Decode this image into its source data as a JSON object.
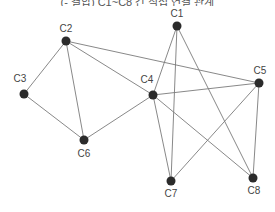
{
  "caption": "(- 결합) C1~C8 간 직접 연결 관계",
  "graph": {
    "nodes": [
      {
        "id": "C1",
        "label": "C1",
        "x": 177,
        "y": 26,
        "lx": 177,
        "ly": 17
      },
      {
        "id": "C2",
        "label": "C2",
        "x": 66,
        "y": 41,
        "lx": 66,
        "ly": 32
      },
      {
        "id": "C3",
        "label": "C3",
        "x": 24,
        "y": 94,
        "lx": 20,
        "ly": 82
      },
      {
        "id": "C4",
        "label": "C4",
        "x": 153,
        "y": 95,
        "lx": 147,
        "ly": 83
      },
      {
        "id": "C5",
        "label": "C5",
        "x": 259,
        "y": 83,
        "lx": 260,
        "ly": 74
      },
      {
        "id": "C6",
        "label": "C6",
        "x": 84,
        "y": 140,
        "lx": 84,
        "ly": 157
      },
      {
        "id": "C7",
        "label": "C7",
        "x": 171,
        "y": 181,
        "lx": 171,
        "ly": 197
      },
      {
        "id": "C8",
        "label": "C8",
        "x": 253,
        "y": 178,
        "lx": 254,
        "ly": 194
      }
    ],
    "edges": [
      [
        "C2",
        "C3"
      ],
      [
        "C2",
        "C6"
      ],
      [
        "C2",
        "C4"
      ],
      [
        "C2",
        "C5"
      ],
      [
        "C3",
        "C6"
      ],
      [
        "C6",
        "C4"
      ],
      [
        "C4",
        "C1"
      ],
      [
        "C4",
        "C5"
      ],
      [
        "C4",
        "C7"
      ],
      [
        "C4",
        "C8"
      ],
      [
        "C1",
        "C7"
      ],
      [
        "C1",
        "C8"
      ],
      [
        "C5",
        "C7"
      ],
      [
        "C5",
        "C8"
      ]
    ]
  }
}
